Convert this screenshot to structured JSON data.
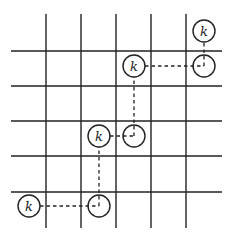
{
  "diagram": {
    "type": "grid-path",
    "grid": {
      "vertical_lines_x": [
        46,
        81,
        116,
        151,
        186
      ],
      "horizontal_lines_y": [
        51,
        86,
        121,
        156,
        192
      ],
      "x_extent": [
        11,
        222
      ],
      "y_extent": [
        14,
        228
      ],
      "color": "#222222"
    },
    "nodes": [
      {
        "id": "k1",
        "label": "k",
        "cx": 29,
        "cy": 206,
        "filled_label": true
      },
      {
        "id": "e1",
        "label": "",
        "cx": 99,
        "cy": 206,
        "filled_label": false
      },
      {
        "id": "k2",
        "label": "k",
        "cx": 99,
        "cy": 136,
        "filled_label": true
      },
      {
        "id": "e2",
        "label": "",
        "cx": 134,
        "cy": 136,
        "filled_label": false
      },
      {
        "id": "k3",
        "label": "k",
        "cx": 134,
        "cy": 66,
        "filled_label": true
      },
      {
        "id": "e3",
        "label": "",
        "cx": 204,
        "cy": 66,
        "filled_label": false
      },
      {
        "id": "k4",
        "label": "k",
        "cx": 204,
        "cy": 31,
        "filled_label": true
      }
    ],
    "edges": [
      {
        "from": "k1",
        "to": "e1",
        "style": "dashed"
      },
      {
        "from": "e1",
        "to": "k2",
        "style": "dashed"
      },
      {
        "from": "k2",
        "to": "e2",
        "style": "dashed"
      },
      {
        "from": "e2",
        "to": "k3",
        "style": "dashed"
      },
      {
        "from": "k3",
        "to": "e3",
        "style": "dashed"
      },
      {
        "from": "e3",
        "to": "k4",
        "style": "dashed"
      }
    ],
    "node_radius": 11
  }
}
